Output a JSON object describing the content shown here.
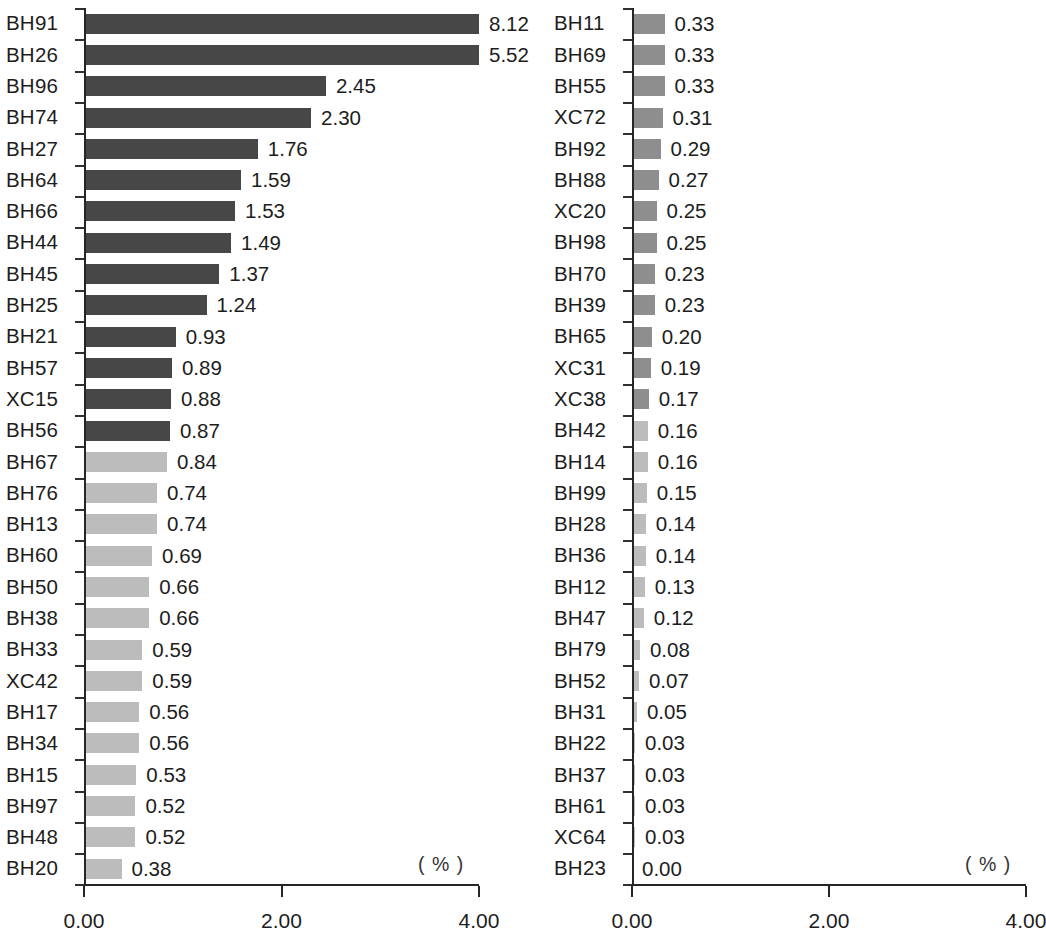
{
  "chart_data": {
    "type": "bar",
    "orientation": "horizontal",
    "title": "",
    "xlabel": "( % )",
    "ylabel": "",
    "xlim": [
      0.0,
      4.0
    ],
    "xticks": [
      "0.00",
      "2.00",
      "4.00"
    ],
    "xtick_values": [
      0.0,
      2.0,
      4.0
    ],
    "grid": false,
    "legend": null,
    "note": "Two side-by-side horizontal bar panels sharing the same 0.00-4.00 percent scale; values sorted descending, continuing from the left panel into the right panel. Bars exceeding 4.00 are clipped at the axis maximum.",
    "panels": [
      {
        "panel_name": "left-panel",
        "unit_label": "( % )",
        "xticks": [
          "0.00",
          "2.00",
          "4.00"
        ],
        "categories": [
          "BH91",
          "BH26",
          "BH96",
          "BH74",
          "BH27",
          "BH64",
          "BH66",
          "BH44",
          "BH45",
          "BH25",
          "BH21",
          "BH57",
          "XC15",
          "BH56",
          "BH67",
          "BH76",
          "BH13",
          "BH60",
          "BH50",
          "BH38",
          "BH33",
          "XC42",
          "BH17",
          "BH34",
          "BH15",
          "BH97",
          "BH48",
          "BH20"
        ],
        "values": [
          8.12,
          5.52,
          2.45,
          2.3,
          1.76,
          1.59,
          1.53,
          1.49,
          1.37,
          1.24,
          0.93,
          0.89,
          0.88,
          0.87,
          0.84,
          0.74,
          0.74,
          0.69,
          0.66,
          0.66,
          0.59,
          0.59,
          0.56,
          0.56,
          0.53,
          0.52,
          0.52,
          0.38
        ],
        "value_labels": [
          "8.12",
          "5.52",
          "2.45",
          "2.30",
          "1.76",
          "1.59",
          "1.53",
          "1.49",
          "1.37",
          "1.24",
          "0.93",
          "0.89",
          "0.88",
          "0.87",
          "0.84",
          "0.74",
          "0.74",
          "0.69",
          "0.66",
          "0.66",
          "0.59",
          "0.59",
          "0.56",
          "0.56",
          "0.53",
          "0.52",
          "0.52",
          "0.38"
        ],
        "shades": [
          "dark",
          "dark",
          "dark",
          "dark",
          "dark",
          "dark",
          "dark",
          "dark",
          "dark",
          "dark",
          "dark",
          "dark",
          "dark",
          "dark",
          "light",
          "light",
          "light",
          "light",
          "light",
          "light",
          "light",
          "light",
          "light",
          "light",
          "light",
          "light",
          "light",
          "light"
        ]
      },
      {
        "panel_name": "right-panel",
        "unit_label": "( % )",
        "xticks": [
          "0.00",
          "2.00",
          "4.00"
        ],
        "categories": [
          "BH11",
          "BH69",
          "BH55",
          "XC72",
          "BH92",
          "BH88",
          "XC20",
          "BH98",
          "BH70",
          "BH39",
          "BH65",
          "XC31",
          "XC38",
          "BH42",
          "BH14",
          "BH99",
          "BH28",
          "BH36",
          "BH12",
          "BH47",
          "BH79",
          "BH52",
          "BH31",
          "BH22",
          "BH37",
          "BH61",
          "XC64",
          "BH23"
        ],
        "values": [
          0.33,
          0.33,
          0.33,
          0.31,
          0.29,
          0.27,
          0.25,
          0.25,
          0.23,
          0.23,
          0.2,
          0.19,
          0.17,
          0.16,
          0.16,
          0.15,
          0.14,
          0.14,
          0.13,
          0.12,
          0.08,
          0.07,
          0.05,
          0.03,
          0.03,
          0.03,
          0.03,
          0.0
        ],
        "value_labels": [
          "0.33",
          "0.33",
          "0.33",
          "0.31",
          "0.29",
          "0.27",
          "0.25",
          "0.25",
          "0.23",
          "0.23",
          "0.20",
          "0.19",
          "0.17",
          "0.16",
          "0.16",
          "0.15",
          "0.14",
          "0.14",
          "0.13",
          "0.12",
          "0.08",
          "0.07",
          "0.05",
          "0.03",
          "0.03",
          "0.03",
          "0.03",
          "0.00"
        ],
        "shades": [
          "mid",
          "mid",
          "mid",
          "mid",
          "mid",
          "mid",
          "mid",
          "mid",
          "mid",
          "mid",
          "mid",
          "mid",
          "mid",
          "light",
          "light",
          "light",
          "light",
          "light",
          "light",
          "light",
          "light",
          "light",
          "light",
          "light",
          "light",
          "light",
          "light",
          "light"
        ]
      }
    ],
    "colors": {
      "dark_bar": "#474747",
      "mid_bar": "#8e8e8e",
      "light_bar": "#bcbcbc",
      "axis": "#262626",
      "text": "#1d1d1d",
      "background": "#ffffff"
    }
  }
}
